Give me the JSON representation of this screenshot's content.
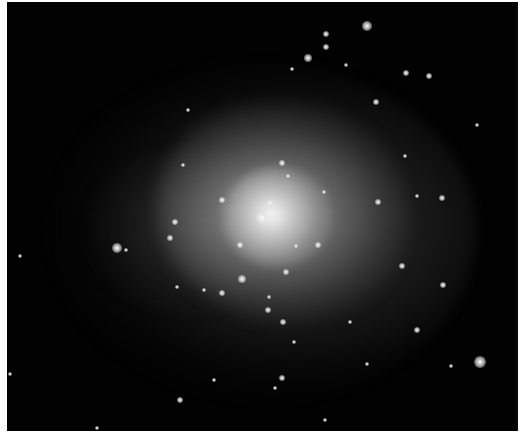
{
  "image": {
    "description": "Astronomical image of a galaxy cluster with diffuse central glow",
    "background_color": "#020202",
    "border_color": "#ffffff",
    "core_color": "#ffffff",
    "halo_color": "#8c8c8c"
  },
  "sources": [
    {
      "x": 367,
      "y": 26,
      "r": 5
    },
    {
      "x": 326,
      "y": 34,
      "r": 3
    },
    {
      "x": 308,
      "y": 58,
      "r": 4
    },
    {
      "x": 326,
      "y": 47,
      "r": 3
    },
    {
      "x": 292,
      "y": 69,
      "r": 2
    },
    {
      "x": 346,
      "y": 65,
      "r": 2
    },
    {
      "x": 406,
      "y": 73,
      "r": 3
    },
    {
      "x": 429,
      "y": 76,
      "r": 3
    },
    {
      "x": 376,
      "y": 102,
      "r": 3
    },
    {
      "x": 188,
      "y": 110,
      "r": 2
    },
    {
      "x": 477,
      "y": 125,
      "r": 2
    },
    {
      "x": 405,
      "y": 156,
      "r": 2
    },
    {
      "x": 282,
      "y": 163,
      "r": 3
    },
    {
      "x": 288,
      "y": 176,
      "r": 2
    },
    {
      "x": 417,
      "y": 196,
      "r": 2
    },
    {
      "x": 442,
      "y": 198,
      "r": 3
    },
    {
      "x": 378,
      "y": 202,
      "r": 3
    },
    {
      "x": 183,
      "y": 165,
      "r": 2
    },
    {
      "x": 222,
      "y": 200,
      "r": 3
    },
    {
      "x": 262,
      "y": 218,
      "r": 6
    },
    {
      "x": 270,
      "y": 203,
      "r": 3
    },
    {
      "x": 324,
      "y": 192,
      "r": 2
    },
    {
      "x": 240,
      "y": 245,
      "r": 3
    },
    {
      "x": 296,
      "y": 246,
      "r": 2
    },
    {
      "x": 318,
      "y": 245,
      "r": 3
    },
    {
      "x": 175,
      "y": 222,
      "r": 3
    },
    {
      "x": 170,
      "y": 238,
      "r": 3
    },
    {
      "x": 117,
      "y": 248,
      "r": 5
    },
    {
      "x": 126,
      "y": 250,
      "r": 2
    },
    {
      "x": 286,
      "y": 272,
      "r": 3
    },
    {
      "x": 242,
      "y": 279,
      "r": 4
    },
    {
      "x": 177,
      "y": 287,
      "r": 2
    },
    {
      "x": 204,
      "y": 290,
      "r": 2
    },
    {
      "x": 222,
      "y": 293,
      "r": 3
    },
    {
      "x": 269,
      "y": 297,
      "r": 2
    },
    {
      "x": 402,
      "y": 266,
      "r": 3
    },
    {
      "x": 443,
      "y": 285,
      "r": 3
    },
    {
      "x": 268,
      "y": 310,
      "r": 3
    },
    {
      "x": 283,
      "y": 322,
      "r": 3
    },
    {
      "x": 294,
      "y": 342,
      "r": 2
    },
    {
      "x": 350,
      "y": 322,
      "r": 2
    },
    {
      "x": 417,
      "y": 330,
      "r": 3
    },
    {
      "x": 480,
      "y": 362,
      "r": 6
    },
    {
      "x": 451,
      "y": 366,
      "r": 2
    },
    {
      "x": 367,
      "y": 364,
      "r": 2
    },
    {
      "x": 282,
      "y": 378,
      "r": 3
    },
    {
      "x": 275,
      "y": 388,
      "r": 2
    },
    {
      "x": 180,
      "y": 400,
      "r": 3
    },
    {
      "x": 325,
      "y": 420,
      "r": 2
    },
    {
      "x": 214,
      "y": 380,
      "r": 2
    },
    {
      "x": 10,
      "y": 374,
      "r": 2
    },
    {
      "x": 97,
      "y": 428,
      "r": 2
    },
    {
      "x": 20,
      "y": 256,
      "r": 2
    }
  ]
}
